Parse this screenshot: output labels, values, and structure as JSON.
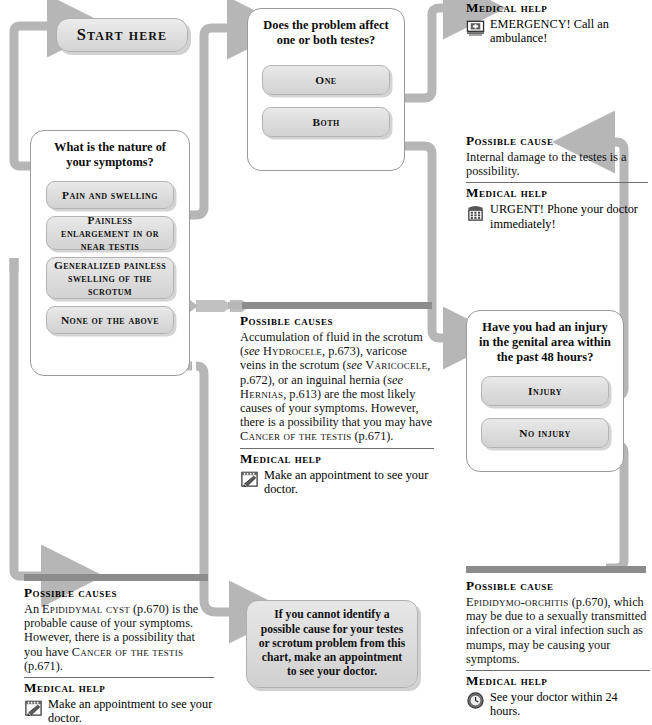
{
  "chart": {
    "start_label": "Start here"
  },
  "questions": [
    {
      "id": "nature",
      "title": "What is the nature of your symptoms?",
      "options": [
        "Pain and swelling",
        "Painless enlargement in or near testis",
        "Generalized painless swelling of the scrotum",
        "None of the above"
      ]
    },
    {
      "id": "sides",
      "title": "Does the problem affect one or both testes?",
      "options": [
        "One",
        "Both"
      ]
    },
    {
      "id": "injury",
      "title": "Have you had an injury in the genital area within the past 48 hours?",
      "options": [
        "Injury",
        "No injury"
      ]
    }
  ],
  "outcomes": {
    "emergency": {
      "help_heading": "Medical help",
      "help_text": "EMERGENCY! Call an ambulance!",
      "help_icon": "ambulance-icon"
    },
    "internal_damage": {
      "cause_heading": "Possible cause",
      "cause_text": "Internal damage to the testes is a possibility.",
      "help_heading": "Medical help",
      "help_text": "URGENT! Phone your doctor immediately!",
      "help_icon": "telephone-icon"
    },
    "scrotum_fluid": {
      "cause_heading": "Possible causes",
      "cause_parts": [
        {
          "t": "Accumulation of fluid in the scrotum (",
          "s": "normal"
        },
        {
          "t": "see",
          "s": "italic"
        },
        {
          "t": " ",
          "s": "normal"
        },
        {
          "t": "Hydrocele",
          "s": "smallcaps"
        },
        {
          "t": ", p.673), varicose veins in the scrotum (",
          "s": "normal"
        },
        {
          "t": "see",
          "s": "italic"
        },
        {
          "t": " ",
          "s": "normal"
        },
        {
          "t": "Varicocele",
          "s": "smallcaps"
        },
        {
          "t": ", p.672), or an inguinal hernia (",
          "s": "normal"
        },
        {
          "t": "see",
          "s": "italic"
        },
        {
          "t": " ",
          "s": "normal"
        },
        {
          "t": "Hernias",
          "s": "smallcaps"
        },
        {
          "t": ", p.613) are the most likely causes of your symptoms. However, there is a possibility that you may have ",
          "s": "normal"
        },
        {
          "t": "Cancer of the testis",
          "s": "smallcaps"
        },
        {
          "t": " (p.671).",
          "s": "normal"
        }
      ],
      "help_heading": "Medical help",
      "help_text": "Make an appointment to see your doctor.",
      "help_icon": "appointment-icon"
    },
    "epididymal_cyst": {
      "cause_heading": "Possible causes",
      "cause_parts": [
        {
          "t": "An ",
          "s": "normal"
        },
        {
          "t": "Epididymal cyst",
          "s": "smallcaps"
        },
        {
          "t": " (p.670) is the probable cause of your symptoms. However, there is a possibility that you have ",
          "s": "normal"
        },
        {
          "t": "Cancer of the testis",
          "s": "smallcaps"
        },
        {
          "t": " (p.671).",
          "s": "normal"
        }
      ],
      "help_heading": "Medical help",
      "help_text": "Make an appointment to see your doctor.",
      "help_icon": "appointment-icon"
    },
    "epididymo_orchitis": {
      "cause_heading": "Possible cause",
      "cause_parts": [
        {
          "t": "Epididymo-orchitis",
          "s": "smallcaps"
        },
        {
          "t": " (p.670), which may be due to a sexually transmitted infection or a viral infection such as mumps, may be causing your symptoms.",
          "s": "normal"
        }
      ],
      "help_heading": "Medical help",
      "help_text": "See your doctor within 24 hours.",
      "help_icon": "clock-icon"
    },
    "no_cause": {
      "text": "If you cannot identify a possible cause for your testes or scrotum problem from this chart, make an appointment to see your doctor."
    }
  },
  "colors": {
    "connector": "#b6b6b6",
    "bar": "#8c8c8c",
    "box_border": "#9a9a9a",
    "button_face": "#dedede"
  }
}
